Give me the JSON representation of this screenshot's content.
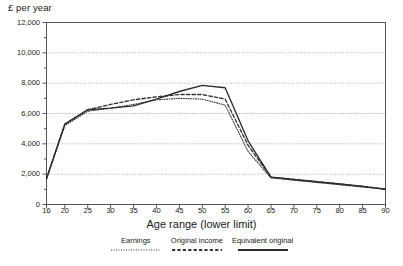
{
  "chart_data": {
    "type": "line",
    "title": "",
    "ylabel": "£ per year",
    "xlabel": "Age range (lower limit)",
    "ylim": [
      0,
      12000
    ],
    "xlim": [
      16,
      90
    ],
    "grid": true,
    "legend_position": "bottom",
    "ytick_labels": [
      "12,000",
      "10,000",
      "8,000",
      "6,000",
      "4,000",
      "2,000",
      "0"
    ],
    "ytick_values": [
      12000,
      10000,
      8000,
      6000,
      4000,
      2000,
      0
    ],
    "yminor_values": [
      11000,
      9000,
      7000,
      5000,
      3000,
      1000
    ],
    "xtick_labels": [
      "16",
      "20",
      "25",
      "30",
      "35",
      "40",
      "45",
      "50",
      "55",
      "60",
      "65",
      "70",
      "75",
      "80",
      "85",
      "90"
    ],
    "xtick_values": [
      16,
      20,
      25,
      30,
      35,
      40,
      45,
      50,
      55,
      60,
      65,
      70,
      75,
      80,
      85,
      90
    ],
    "x": [
      16,
      20,
      25,
      30,
      35,
      40,
      45,
      50,
      55,
      60,
      65,
      70,
      75,
      80,
      85,
      90
    ],
    "series": [
      {
        "name": "Earnings",
        "style": "dotted",
        "color": "#333333",
        "values": [
          1700,
          5200,
          6150,
          6350,
          6600,
          6900,
          7000,
          6950,
          6550,
          3500,
          1750,
          1600,
          1450,
          1300,
          1150,
          1000
        ]
      },
      {
        "name": "Original income",
        "style": "dashed",
        "color": "#333333",
        "values": [
          1700,
          5300,
          6250,
          6600,
          6900,
          7100,
          7250,
          7250,
          6950,
          3900,
          1800,
          1650,
          1500,
          1350,
          1200,
          1020
        ]
      },
      {
        "name": "Equivalent original",
        "style": "solid",
        "color": "#2a2a2a",
        "values": [
          1700,
          5300,
          6250,
          6350,
          6500,
          6950,
          7450,
          7850,
          7700,
          4200,
          1800,
          1650,
          1500,
          1350,
          1200,
          1000
        ]
      }
    ]
  },
  "legend": {
    "entries": [
      {
        "label": "Earnings"
      },
      {
        "label": "Original income"
      },
      {
        "label": "Equivalent original"
      }
    ]
  }
}
